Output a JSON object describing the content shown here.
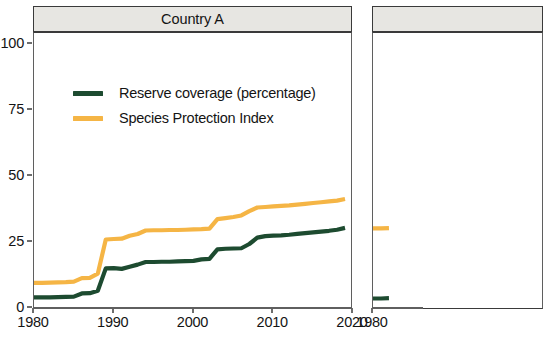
{
  "figure": {
    "background": "#ffffff",
    "axis_color": "#5f5f5f",
    "strip_fill": "#e7e6e2",
    "strip_border": "#3a3a3a"
  },
  "legend": {
    "position": "top-left-inside-panel",
    "entries": [
      {
        "label": "Reserve coverage (percentage)",
        "color": "#1d4b30"
      },
      {
        "label": "Species Protection Index",
        "color": "#f5b545"
      }
    ]
  },
  "panels": [
    {
      "title": "Country A",
      "clipped": false
    },
    {
      "title": "",
      "clipped": true
    }
  ],
  "axes": {
    "y_ticks": [
      "0",
      "25",
      "50",
      "75",
      "100"
    ],
    "y_tick_values": [
      0,
      25,
      50,
      75,
      100
    ],
    "x_ticks": [
      "1980",
      "1990",
      "2000",
      "2010",
      "2020"
    ],
    "x_tick_values": [
      1980,
      1990,
      2000,
      2010,
      2020
    ],
    "ylim": [
      0,
      104
    ],
    "xlim": [
      1980,
      2020
    ],
    "xlabel": "",
    "ylabel": ""
  },
  "chart_data": {
    "type": "line",
    "title": "Country A",
    "xlabel": "",
    "ylabel": "",
    "xlim": [
      1980,
      2020
    ],
    "ylim": [
      0,
      104
    ],
    "grid": false,
    "legend_position": "top-left",
    "x_ticks": [
      1980,
      1990,
      2000,
      2010,
      2020
    ],
    "y_ticks": [
      0,
      25,
      50,
      75,
      100
    ],
    "panels": [
      {
        "name": "Country A",
        "x": [
          1980,
          1981,
          1982,
          1983,
          1984,
          1985,
          1986,
          1987,
          1988,
          1989,
          1990,
          1991,
          1992,
          1993,
          1994,
          1995,
          1996,
          1997,
          1998,
          1999,
          2000,
          2001,
          2002,
          2003,
          2004,
          2005,
          2006,
          2007,
          2008,
          2009,
          2010,
          2011,
          2012,
          2013,
          2014,
          2015,
          2016,
          2017,
          2018,
          2019
        ],
        "series": [
          {
            "name": "Reserve coverage (percentage)",
            "color": "#1d4b30",
            "values": [
              4.0,
              4.0,
              4.0,
              4.1,
              4.2,
              4.3,
              5.5,
              5.6,
              6.5,
              15.0,
              15.1,
              14.8,
              15.6,
              16.4,
              17.4,
              17.4,
              17.5,
              17.5,
              17.6,
              17.7,
              17.8,
              18.4,
              18.6,
              22.2,
              22.4,
              22.5,
              22.6,
              24.2,
              26.6,
              27.2,
              27.4,
              27.5,
              27.7,
              28.0,
              28.3,
              28.6,
              28.9,
              29.2,
              29.6,
              30.3
            ]
          },
          {
            "name": "Species Protection Index",
            "color": "#f5b545",
            "values": [
              9.5,
              9.5,
              9.6,
              9.7,
              9.8,
              10.0,
              11.3,
              11.4,
              13.0,
              25.9,
              26.1,
              26.2,
              27.3,
              28.0,
              29.3,
              29.4,
              29.4,
              29.5,
              29.5,
              29.6,
              29.7,
              29.8,
              30.0,
              33.6,
              34.0,
              34.4,
              35.0,
              36.6,
              38.0,
              38.2,
              38.4,
              38.6,
              38.8,
              39.1,
              39.4,
              39.7,
              40.0,
              40.3,
              40.6,
              41.2
            ]
          }
        ]
      },
      {
        "name": "",
        "clipped": true,
        "x": [
          1980,
          1981,
          1982
        ],
        "series": [
          {
            "name": "Reserve coverage (percentage)",
            "color": "#1d4b30",
            "values": [
              3.6,
              3.6,
              3.7
            ]
          },
          {
            "name": "Species Protection Index",
            "color": "#f5b545",
            "values": [
              30.1,
              30.1,
              30.2
            ]
          }
        ]
      }
    ]
  }
}
